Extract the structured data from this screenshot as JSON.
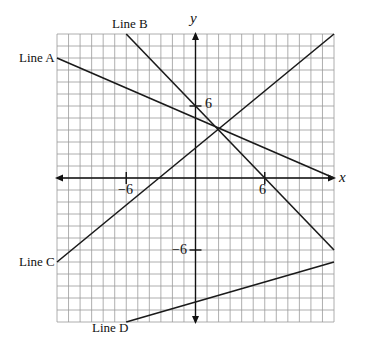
{
  "chart_data": {
    "type": "line",
    "title": "",
    "xlabel": "x",
    "ylabel": "y",
    "xlim": [
      -12,
      12
    ],
    "ylim": [
      -12,
      12
    ],
    "grid": true,
    "grid_step": 1,
    "ticks_labeled": {
      "x": [
        -6,
        6
      ],
      "y": [
        6,
        -6
      ]
    },
    "series": [
      {
        "name": "Line A",
        "points": [
          [
            -12,
            10
          ],
          [
            12,
            0
          ]
        ]
      },
      {
        "name": "Line B",
        "points": [
          [
            -6,
            12
          ],
          [
            12,
            -6
          ]
        ]
      },
      {
        "name": "Line C",
        "points": [
          [
            -12,
            -7
          ],
          [
            12,
            12
          ]
        ]
      },
      {
        "name": "Line D",
        "points": [
          [
            -6,
            -12
          ],
          [
            12,
            -7
          ]
        ]
      }
    ]
  },
  "labels": {
    "line_a": "Line A",
    "line_b": "Line B",
    "line_c": "Line C",
    "line_d": "Line D",
    "x_axis": "x",
    "y_axis": "y",
    "tick_x_neg6": "−6",
    "tick_x_6": "6",
    "tick_y_6": "6",
    "tick_y_neg6": "−6"
  },
  "colors": {
    "grid": "#9a9a9a",
    "axis": "#111111",
    "line": "#1a1a1a"
  }
}
